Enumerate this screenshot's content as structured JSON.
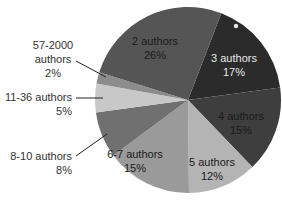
{
  "chart_data": {
    "type": "pie",
    "title": "",
    "start_angle_deg": 21,
    "direction": "clockwise",
    "categories": [
      "3 authors",
      "4 authors",
      "5 authors",
      "6-7 authors",
      "8-10 authors",
      "11-36 authors",
      "57-2000 authors",
      "2 authors"
    ],
    "values": [
      17,
      15,
      12,
      15,
      8,
      5,
      2,
      26
    ],
    "unit": "%",
    "colors": [
      "#2b2b2b",
      "#3e3e3e",
      "#b4b4b4",
      "#9a9a9a",
      "#707070",
      "#c8c8c8",
      "#8c8c8c",
      "#555555"
    ],
    "labels": [
      {
        "line1": "3 authors",
        "line2": "17%",
        "color": "#e8e8e8",
        "x": 234,
        "y": 62,
        "anchor": "middle"
      },
      {
        "line1": "4 authors",
        "line2": "15%",
        "color": "#1a1a1a",
        "x": 241,
        "y": 120,
        "anchor": "middle"
      },
      {
        "line1": "5 authors",
        "line2": "12%",
        "color": "#1a1a1a",
        "x": 212,
        "y": 166,
        "anchor": "middle"
      },
      {
        "line1": "6-7 authors",
        "line2": "15%",
        "color": "#1a1a1a",
        "x": 135,
        "y": 158,
        "anchor": "middle"
      },
      {
        "line1": "8-10 authors",
        "line2": "8%",
        "color": "#333333",
        "x": 72,
        "y": 160,
        "anchor": "end",
        "leader": [
          [
            76,
            156
          ],
          [
            107,
            134
          ]
        ]
      },
      {
        "line1": "11-36 authors",
        "line2": "5%",
        "color": "#333333",
        "x": 72,
        "y": 101,
        "anchor": "end",
        "leader": [
          [
            76,
            98
          ],
          [
            103,
            98
          ]
        ]
      },
      {
        "line1": "57-2000",
        "line2": "authors",
        "line3": "2%",
        "color": "#333333",
        "x": 53,
        "y": 49,
        "anchor": "middle",
        "leader": [
          [
            76,
            61
          ],
          [
            106,
            77
          ]
        ]
      },
      {
        "line1": "2 authors",
        "line2": "26%",
        "color": "#1a1a1a",
        "x": 155,
        "y": 45,
        "anchor": "middle"
      }
    ],
    "legend": "none",
    "marker": {
      "x": 236,
      "y": 26,
      "color": "#e6e6e6"
    }
  }
}
